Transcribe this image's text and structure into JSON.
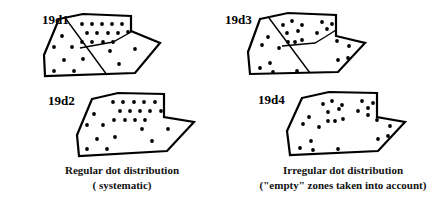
{
  "panels": {
    "d1": {
      "label": "19d1",
      "label_pos": [
        42,
        24
      ],
      "outline": "59,19 83,14 131,16 131,31 160,43 135,73 45,76 44,55",
      "dividers": [
        "66,19 107,75",
        "80,48 113,42 131,32"
      ],
      "dots": [
        [
          82,
          24
        ],
        [
          92,
          24
        ],
        [
          102,
          24
        ],
        [
          112,
          24
        ],
        [
          122,
          24
        ],
        [
          87,
          33
        ],
        [
          97,
          33
        ],
        [
          108,
          33
        ],
        [
          118,
          33
        ],
        [
          128,
          32
        ],
        [
          82,
          42
        ],
        [
          92,
          42
        ],
        [
          103,
          42
        ],
        [
          113,
          42
        ],
        [
          62,
          36
        ],
        [
          54,
          47
        ],
        [
          72,
          47
        ],
        [
          64,
          60
        ],
        [
          83,
          59
        ],
        [
          54,
          71
        ],
        [
          74,
          71
        ],
        [
          110,
          51
        ],
        [
          135,
          49
        ],
        [
          119,
          64
        ]
      ]
    },
    "d2": {
      "label": "19d2",
      "label_pos": [
        48,
        105
      ],
      "outline": "92,99 118,93 164,94 164,117 194,122 167,151 79,156 77,135",
      "dividers": [],
      "dots": [
        [
          113,
          102
        ],
        [
          123,
          102
        ],
        [
          134,
          102
        ],
        [
          144,
          102
        ],
        [
          155,
          102
        ],
        [
          120,
          111
        ],
        [
          130,
          111
        ],
        [
          140,
          111
        ],
        [
          150,
          111
        ],
        [
          161,
          111
        ],
        [
          114,
          120
        ],
        [
          125,
          120
        ],
        [
          135,
          120
        ],
        [
          145,
          120
        ],
        [
          94,
          114
        ],
        [
          87,
          125
        ],
        [
          103,
          125
        ],
        [
          142,
          129
        ],
        [
          168,
          129
        ],
        [
          97,
          139
        ],
        [
          115,
          137
        ],
        [
          152,
          141
        ],
        [
          87,
          149
        ],
        [
          107,
          149
        ]
      ]
    },
    "d3": {
      "label": "19d3",
      "label_pos": [
        225,
        24
      ],
      "outline": "260,19 288,13 336,15 336,36 365,43 338,72 250,74 248,52",
      "dividers": [
        "269,18 310,73",
        "282,46 315,43 325,37 336,30"
      ],
      "dots": [
        [
          283,
          25
        ],
        [
          292,
          21
        ],
        [
          302,
          25
        ],
        [
          298,
          31
        ],
        [
          287,
          33
        ],
        [
          322,
          22
        ],
        [
          332,
          24
        ],
        [
          327,
          29
        ],
        [
          317,
          33
        ],
        [
          288,
          42
        ],
        [
          295,
          42
        ],
        [
          302,
          40
        ],
        [
          268,
          37
        ],
        [
          262,
          45
        ],
        [
          279,
          48
        ],
        [
          270,
          63
        ],
        [
          260,
          68
        ],
        [
          273,
          72
        ],
        [
          297,
          71
        ],
        [
          337,
          41
        ],
        [
          349,
          46
        ],
        [
          338,
          60
        ],
        [
          348,
          58
        ]
      ]
    },
    "d4": {
      "label": "19d4",
      "label_pos": [
        258,
        104
      ],
      "outline": "302,98 329,92 377,93 377,117 405,122 378,151 290,155 287,131",
      "dividers": [],
      "dots": [
        [
          323,
          104
        ],
        [
          332,
          101
        ],
        [
          342,
          105
        ],
        [
          339,
          109
        ],
        [
          328,
          112
        ],
        [
          309,
          117
        ],
        [
          303,
          124
        ],
        [
          328,
          121
        ],
        [
          335,
          121
        ],
        [
          343,
          119
        ],
        [
          319,
          127
        ],
        [
          362,
          101
        ],
        [
          373,
          103
        ],
        [
          368,
          108
        ],
        [
          358,
          111
        ],
        [
          368,
          115
        ],
        [
          377,
          120
        ],
        [
          390,
          126
        ],
        [
          388,
          136
        ],
        [
          378,
          139
        ],
        [
          311,
          141
        ],
        [
          300,
          148
        ],
        [
          313,
          150
        ],
        [
          338,
          149
        ]
      ]
    }
  },
  "captions": {
    "left": {
      "line1": "Regular dot distribution",
      "line2": "( systematic)"
    },
    "right": {
      "line1": "Irregular dot distribution",
      "line2": "(\"empty\" zones taken into account)"
    }
  }
}
